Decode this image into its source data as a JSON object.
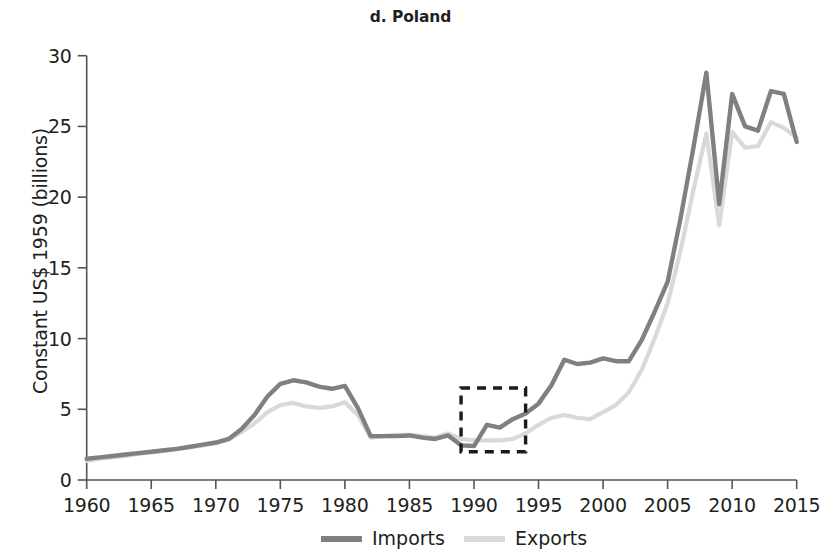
{
  "figure": {
    "title": "d. Poland",
    "y_axis_title": "Constant US$ 1959 (billions)"
  },
  "legend": {
    "items": [
      {
        "label": "Imports",
        "color": "#808080"
      },
      {
        "label": "Exports",
        "color": "#d9d9d9"
      }
    ]
  },
  "annotations": {
    "highlight_box": {
      "label": "dashed-highlight-1989-1994",
      "x_start": 1989,
      "x_end": 1994,
      "y_bottom": 2.0,
      "y_top": 6.5
    }
  },
  "chart_data": {
    "type": "line",
    "title": "d. Poland",
    "xlabel": "",
    "ylabel": "Constant US$ 1959 (billions)",
    "xlim": [
      1960,
      2015
    ],
    "ylim": [
      0,
      30
    ],
    "xticks": [
      1960,
      1965,
      1970,
      1975,
      1980,
      1985,
      1990,
      1995,
      2000,
      2005,
      2010,
      2015
    ],
    "yticks": [
      0,
      5,
      10,
      15,
      20,
      25,
      30
    ],
    "grid": false,
    "legend_position": "bottom-center",
    "x": [
      1960,
      1961,
      1962,
      1963,
      1964,
      1965,
      1966,
      1967,
      1968,
      1969,
      1970,
      1971,
      1972,
      1973,
      1974,
      1975,
      1976,
      1977,
      1978,
      1979,
      1980,
      1981,
      1982,
      1983,
      1984,
      1985,
      1986,
      1987,
      1988,
      1989,
      1990,
      1991,
      1992,
      1993,
      1994,
      1995,
      1996,
      1997,
      1998,
      1999,
      2000,
      2001,
      2002,
      2003,
      2004,
      2005,
      2006,
      2007,
      2008,
      2009,
      2010,
      2011,
      2012,
      2013,
      2014,
      2015
    ],
    "series": [
      {
        "name": "Imports",
        "color": "#808080",
        "values": [
          1.5,
          1.6,
          1.7,
          1.8,
          1.9,
          2.0,
          2.1,
          2.2,
          2.35,
          2.5,
          2.65,
          2.9,
          3.6,
          4.6,
          5.9,
          6.8,
          7.05,
          6.9,
          6.6,
          6.45,
          6.65,
          5.1,
          3.1,
          3.1,
          3.1,
          3.15,
          3.0,
          2.9,
          3.15,
          2.45,
          2.4,
          3.9,
          3.7,
          4.3,
          4.7,
          5.4,
          6.7,
          8.5,
          8.2,
          8.3,
          8.6,
          8.4,
          8.4,
          9.9,
          11.9,
          14.0,
          18.5,
          23.5,
          28.8,
          19.5,
          27.3,
          25.0,
          24.7,
          27.5,
          27.3,
          23.9
        ]
      },
      {
        "name": "Exports",
        "color": "#d9d9d9",
        "values": [
          1.35,
          1.5,
          1.6,
          1.7,
          1.85,
          1.95,
          2.05,
          2.2,
          2.3,
          2.45,
          2.6,
          2.85,
          3.4,
          4.0,
          4.8,
          5.3,
          5.45,
          5.2,
          5.1,
          5.2,
          5.5,
          4.6,
          3.0,
          3.1,
          3.2,
          3.2,
          3.1,
          3.0,
          3.3,
          2.9,
          2.8,
          2.8,
          2.8,
          2.9,
          3.3,
          3.9,
          4.4,
          4.6,
          4.4,
          4.3,
          4.8,
          5.3,
          6.2,
          7.8,
          10.0,
          12.5,
          16.2,
          20.5,
          24.5,
          18.0,
          24.6,
          23.5,
          23.6,
          25.3,
          24.9,
          24.2
        ]
      }
    ]
  }
}
